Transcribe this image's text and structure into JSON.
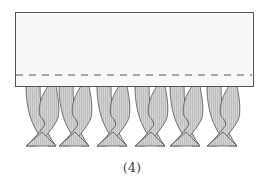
{
  "figure": {
    "caption": "(4)",
    "fabric": {
      "fill": "#f7f7f7",
      "stroke": "#555555"
    },
    "stitch_line": {
      "style": "dashed",
      "color": "#555555"
    },
    "fringe": {
      "twist_count": 6,
      "fill": "#cfcfcf",
      "stroke": "#555555"
    }
  }
}
